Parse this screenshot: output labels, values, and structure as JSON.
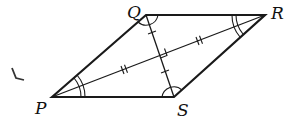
{
  "diagram": {
    "type": "rhombus",
    "vertices": [
      {
        "name": "P",
        "x": 52,
        "y": 97
      },
      {
        "name": "Q",
        "x": 146,
        "y": 15
      },
      {
        "name": "R",
        "x": 265,
        "y": 15
      },
      {
        "name": "S",
        "x": 174,
        "y": 97
      }
    ],
    "labels": {
      "P": "P",
      "Q": "Q",
      "R": "R",
      "S": "S"
    },
    "diagonals": [
      "PR",
      "QS"
    ],
    "markings": {
      "right_angle_at_intersection": true,
      "PR_halves_tick": "double",
      "QS_halves_tick": "single",
      "angle_P": "double-arc",
      "angle_R": "double-arc",
      "angle_Q": "single-arc",
      "angle_S": "single-arc"
    },
    "stroke_color": "#1a1a1a"
  }
}
